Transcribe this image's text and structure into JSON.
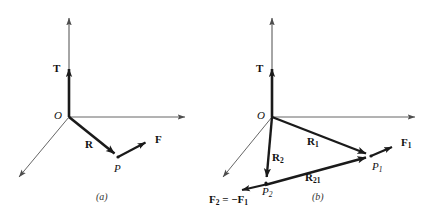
{
  "figure": {
    "title_alt": "Position and force vectors for a particle P relative to origin O, and for a pair of particles P1, P2 with equal and opposite forces",
    "background_color": "#ffffff",
    "stroke_color": "#1a1a1a",
    "axis_color": "#4d4d4d",
    "panels": [
      {
        "id": "a",
        "caption": "(a)",
        "caption_x": 96,
        "caption_y": 192,
        "origin_label": "O",
        "origin_label_x": 54,
        "origin_label_y": 110,
        "axes": {
          "vertical_label": "T",
          "vertical_label_x": 53,
          "vertical_label_y": 63,
          "vertical": {
            "x1": 69,
            "y1": 117,
            "x2": 69,
            "y2": 13
          },
          "horizontal": {
            "x1": 69,
            "y1": 117,
            "x2": 191,
            "y2": 117
          },
          "diagonal": {
            "x1": 69,
            "y1": 117,
            "x2": 15,
            "y2": 182
          },
          "t_segment": {
            "x1": 69,
            "y1": 117,
            "x2": 69,
            "y2": 67
          }
        },
        "vectors": [
          {
            "name": "R",
            "label": "R",
            "label_x": 85,
            "label_y": 139,
            "x1": 69,
            "y1": 117,
            "x2": 118,
            "y2": 157
          },
          {
            "name": "F",
            "label": "F",
            "label_x": 155,
            "label_y": 134,
            "x1": 118,
            "y1": 157,
            "x2": 150,
            "y2": 140
          }
        ],
        "points": [
          {
            "label": "P",
            "label_x": 114,
            "label_y": 163,
            "x": 118,
            "y": 157
          }
        ]
      },
      {
        "id": "b",
        "caption": "(b)",
        "caption_x": 312,
        "caption_y": 192,
        "origin_label": "O",
        "origin_label_x": 257,
        "origin_label_y": 110,
        "axes": {
          "vertical_label": "T",
          "vertical_label_x": 256,
          "vertical_label_y": 63,
          "vertical": {
            "x1": 272,
            "y1": 117,
            "x2": 272,
            "y2": 13
          },
          "horizontal": {
            "x1": 272,
            "y1": 117,
            "x2": 421,
            "y2": 117
          },
          "diagonal": {
            "x1": 272,
            "y1": 117,
            "x2": 219,
            "y2": 182
          },
          "t_segment": {
            "x1": 272,
            "y1": 117,
            "x2": 272,
            "y2": 67
          }
        },
        "vectors": [
          {
            "name": "R1",
            "label": "R",
            "sub": "1",
            "label_x": 307,
            "label_y": 136,
            "x1": 272,
            "y1": 117,
            "x2": 371,
            "y2": 156
          },
          {
            "name": "R2",
            "label": "R",
            "sub": "2",
            "label_x": 272,
            "label_y": 152,
            "x1": 272,
            "y1": 117,
            "x2": 266,
            "y2": 182
          },
          {
            "name": "R21",
            "label": "R",
            "sub": "21",
            "label_x": 305,
            "label_y": 172,
            "x1": 265,
            "y1": 185,
            "x2": 371,
            "y2": 156
          },
          {
            "name": "F1",
            "label": "F",
            "sub": "1",
            "label_x": 401,
            "label_y": 137,
            "x1": 371,
            "y1": 156,
            "x2": 396,
            "y2": 145
          },
          {
            "name": "F2",
            "label": "F",
            "sub": "2",
            "equation_text": "= −F",
            "equation_sub": "1",
            "label_x": 209,
            "label_y": 194,
            "x1": 268,
            "y1": 184,
            "x2": 237,
            "y2": 191
          }
        ],
        "points": [
          {
            "label": "P",
            "sub": "1",
            "label_x": 372,
            "label_y": 161,
            "x": 371,
            "y": 156
          },
          {
            "label": "P",
            "sub": "2",
            "label_x": 262,
            "label_y": 186,
            "x": 266,
            "y": 183
          }
        ]
      }
    ]
  }
}
